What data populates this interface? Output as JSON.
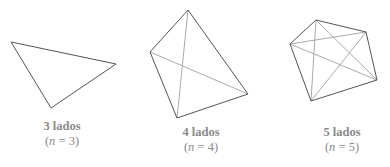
{
  "figures": [
    {
      "title": "3 lados",
      "var": "n",
      "eq": " = 3)",
      "open": "(",
      "sides": 3,
      "vertices": [
        [
          11,
          42
        ],
        [
          116,
          64
        ],
        [
          51,
          108
        ]
      ],
      "diagonals": []
    },
    {
      "title": "4 lados",
      "var": "n",
      "eq": " = 4)",
      "open": "(",
      "sides": 4,
      "vertices": [
        [
          188,
          10
        ],
        [
          248,
          94
        ],
        [
          177,
          118
        ],
        [
          150,
          52
        ]
      ],
      "diagonals": [
        [
          0,
          2
        ],
        [
          1,
          3
        ]
      ]
    },
    {
      "title": "5 lados",
      "var": "n",
      "eq": " = 5)",
      "open": "(",
      "sides": 5,
      "vertices": [
        [
          316,
          20
        ],
        [
          366,
          32
        ],
        [
          377,
          80
        ],
        [
          311,
          101
        ],
        [
          290,
          44
        ]
      ],
      "diagonals": [
        [
          0,
          2
        ],
        [
          0,
          3
        ],
        [
          1,
          3
        ],
        [
          1,
          4
        ],
        [
          2,
          4
        ]
      ]
    }
  ],
  "colors": {
    "edge": "#555555",
    "diagonal": "#aaaaaa",
    "label": "#8a8a8a"
  }
}
